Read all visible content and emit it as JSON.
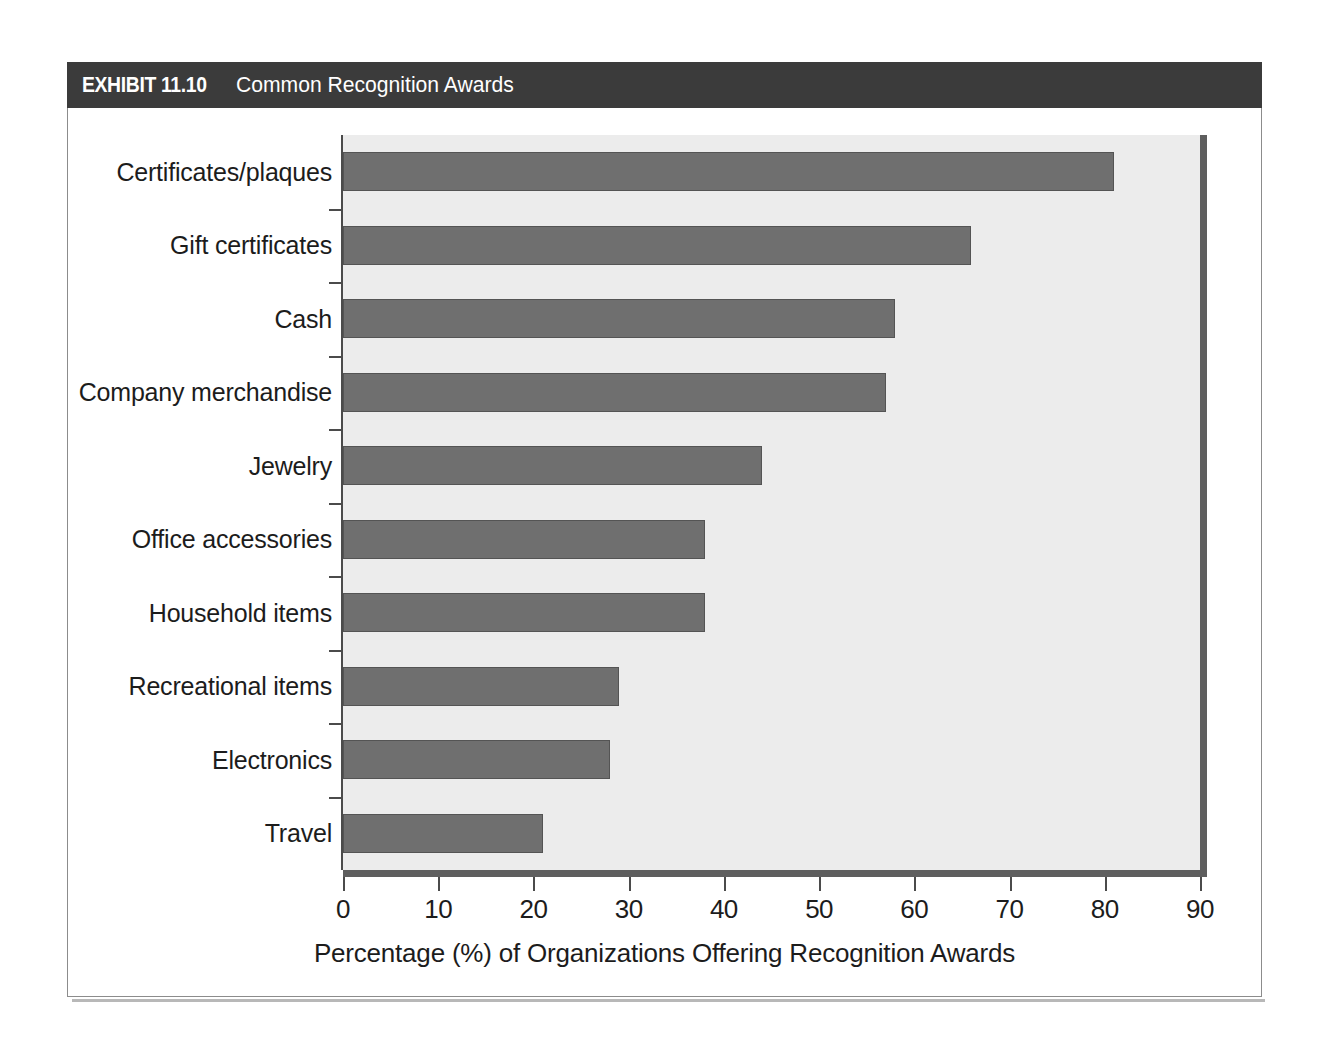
{
  "exhibit": {
    "number": "EXHIBIT 11.10",
    "title": "Common Recognition Awards"
  },
  "chart_data": {
    "type": "bar",
    "orientation": "horizontal",
    "title": "Common Recognition Awards",
    "categories": [
      "Certificates/plaques",
      "Gift certificates",
      "Cash",
      "Company merchandise",
      "Jewelry",
      "Office accessories",
      "Household items",
      "Recreational items",
      "Electronics",
      "Travel"
    ],
    "values": [
      81,
      66,
      58,
      57,
      44,
      38,
      38,
      29,
      28,
      21
    ],
    "xlabel": "Percentage (%) of Organizations Offering Recognition Awards",
    "ylabel": "",
    "xlim": [
      0,
      90
    ],
    "xticks": [
      0,
      10,
      20,
      30,
      40,
      50,
      60,
      70,
      80,
      90
    ],
    "xtick_labels": [
      "0",
      "10",
      "20",
      "30",
      "40",
      "50",
      "60",
      "70",
      "80",
      "90"
    ],
    "grid": false,
    "legend": false,
    "bar_color": "#6f6f6f",
    "plot_background": "#ececec",
    "axis_color": "#4b4b4b"
  }
}
